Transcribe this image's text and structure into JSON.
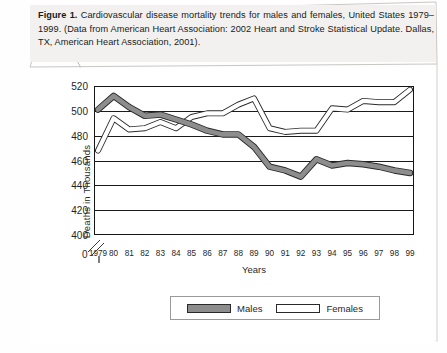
{
  "caption": {
    "figure_label": "Figure 1.",
    "text": " Cardiovascular disease mortality trends for males and females, United States 1979–1999. (Data from American Heart Association: 2002 Heart and Stroke Statistical Update. Dallas, TX, American Heart Association, 2001)."
  },
  "legend": {
    "males_label": "Males",
    "females_label": "Females"
  },
  "axes": {
    "ylabel": "Deaths in Thousands",
    "xlabel": "Years",
    "zero_tick": "0"
  },
  "colors": {
    "males_fill": "#8d8d8d",
    "males_stroke": "#2a2a2a",
    "females_fill": "#ffffff",
    "females_stroke": "#2a2a2a",
    "gridline": "#1b1b1b",
    "caption_bg": "#f2f1ef"
  },
  "chart_data": {
    "type": "line",
    "xlabel": "Years",
    "ylabel": "Deaths in Thousands",
    "grid": true,
    "legend_position": "bottom",
    "axis_break": true,
    "ylim": [
      400,
      520
    ],
    "yticks": [
      400,
      420,
      440,
      460,
      480,
      500,
      520
    ],
    "ytick_labels": [
      "400",
      "420",
      "440",
      "460",
      "480",
      "500",
      "520"
    ],
    "categories": [
      "1979",
      "80",
      "81",
      "82",
      "83",
      "84",
      "85",
      "86",
      "87",
      "88",
      "89",
      "90",
      "91",
      "92",
      "93",
      "94",
      "95",
      "96",
      "97",
      "98",
      "99"
    ],
    "x": [
      1979,
      1980,
      1981,
      1982,
      1983,
      1984,
      1985,
      1986,
      1987,
      1988,
      1989,
      1990,
      1991,
      1992,
      1993,
      1994,
      1995,
      1996,
      1997,
      1998,
      1999
    ],
    "series": [
      {
        "name": "Males",
        "style": "thick-gray-band",
        "values": [
          501,
          512,
          503,
          496,
          497,
          493,
          489,
          484,
          481,
          481,
          471,
          455,
          452,
          447,
          461,
          456,
          458,
          457,
          455,
          452,
          450
        ]
      },
      {
        "name": "Females",
        "style": "thick-white-band",
        "values": [
          468,
          494,
          485,
          486,
          491,
          486,
          495,
          498,
          498,
          505,
          510,
          486,
          483,
          484,
          484,
          502,
          501,
          508,
          507,
          507,
          517
        ]
      }
    ]
  }
}
